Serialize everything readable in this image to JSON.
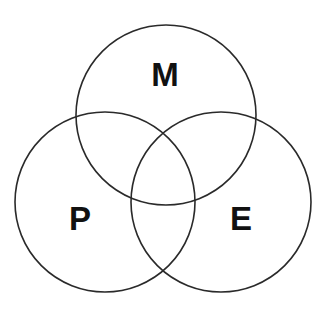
{
  "diagram": {
    "type": "venn",
    "stroke_color": "#2a2a2a",
    "circles": [
      {
        "id": "M",
        "label": "M",
        "cx": 166,
        "cy": 115,
        "r": 90,
        "label_x": 165,
        "label_y": 86
      },
      {
        "id": "P",
        "label": "P",
        "cx": 105,
        "cy": 202,
        "r": 90,
        "label_x": 80,
        "label_y": 230
      },
      {
        "id": "E",
        "label": "E",
        "cx": 221,
        "cy": 202,
        "r": 90,
        "label_x": 241,
        "label_y": 230
      }
    ]
  }
}
